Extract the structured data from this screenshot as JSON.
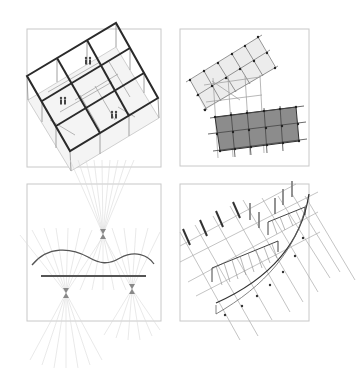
{
  "figure": {
    "layout": "2x2 grid of architectural diagram panels",
    "background": "#ffffff",
    "colors": {
      "frame": "#c8c8c8",
      "structure_bold": "#2a2a2a",
      "structure_thin": "#9a9a9a",
      "ray": "#d9d9d9",
      "light_fill": "#ececec",
      "dark_fill": "#8c8c8c",
      "node": "#333333"
    },
    "panels": [
      {
        "id": "top-left",
        "subject": "isometric 3x3 bay building frame with human figures"
      },
      {
        "id": "top-right",
        "subject": "rotated light grid overlaying a dark shaded grid with nodes"
      },
      {
        "id": "bottom-left",
        "subject": "sightline fans converging on a wavy curve and straight line"
      },
      {
        "id": "bottom-right",
        "subject": "curved edge with projected columns and hatched strips"
      }
    ]
  }
}
